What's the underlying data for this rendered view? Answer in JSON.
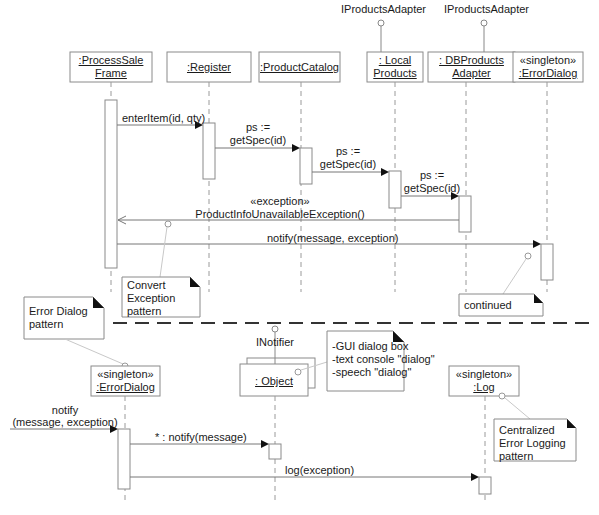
{
  "upper": {
    "lifelines": [
      {
        "id": "processSaleFrame",
        "line1": ":ProcessSale",
        "line2": "Frame"
      },
      {
        "id": "register",
        "line1": ":Register"
      },
      {
        "id": "productCatalog",
        "line1": ":ProductCatalog"
      },
      {
        "id": "localProducts",
        "line1": ": Local",
        "line2": "Products",
        "interface": "IProductsAdapter"
      },
      {
        "id": "dbProductsAdapter",
        "line1": ": DBProducts",
        "line2": "Adapter",
        "interface": "IProductsAdapter"
      },
      {
        "id": "errorDialog",
        "stereotype": "«singleton»",
        "line1": ":ErrorDialog"
      }
    ],
    "messages": [
      {
        "label": "enterItem(id, qty)"
      },
      {
        "label1": "ps :=",
        "label2": "getSpec(id)"
      },
      {
        "label1": "ps :=",
        "label2": "getSpec(id)"
      },
      {
        "label1": "ps :=",
        "label2": "getSpec(id)"
      },
      {
        "label1": "«exception»",
        "label2": "ProductInfoUnavailableException()"
      },
      {
        "label": "notify(message, exception)"
      }
    ],
    "notes": {
      "convert": [
        "Convert",
        "Exception",
        "pattern"
      ],
      "continued": "continued"
    }
  },
  "lower": {
    "lifelines": [
      {
        "id": "errorDialog",
        "stereotype": "«singleton»",
        "line1": ":ErrorDialog"
      },
      {
        "id": "object",
        "line1": ": Object",
        "interface": "INotifier"
      },
      {
        "id": "log",
        "stereotype": "«singleton»",
        "line1": ":Log"
      }
    ],
    "messages": [
      {
        "label1": "notify",
        "label2": "(message, exception)"
      },
      {
        "label": "* : notify(message)"
      },
      {
        "label": "log(exception)"
      }
    ],
    "notes": {
      "errorDialog": [
        "Error Dialog",
        "pattern"
      ],
      "variants": [
        "-GUI dialog box",
        "-text console \"dialog\"",
        "-speech \"dialog\""
      ],
      "centralized": [
        "Centralized",
        "Error Logging",
        "pattern"
      ]
    }
  }
}
